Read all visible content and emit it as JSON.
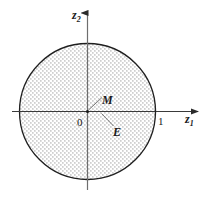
{
  "figure": {
    "background_color": "#ffffff",
    "axes": {
      "x_axis": {
        "label": "z",
        "subscript": "1",
        "name": "horizontal-axis",
        "arrow": "right"
      },
      "y_axis": {
        "label": "z",
        "subscript": "2",
        "name": "vertical-axis",
        "arrow": "up"
      },
      "origin_label": "0"
    },
    "ticks": {
      "x_ticks": [
        {
          "value": "1",
          "position": 1.0
        }
      ]
    },
    "shapes": [
      {
        "name": "unit-disc",
        "type": "circle",
        "center": [
          0,
          0
        ],
        "radius": 1.0,
        "fill": "stipple-dots",
        "fill_color": "#9a9a9a",
        "stroke_color": "#1a1a1a"
      }
    ],
    "annotations": [
      {
        "name": "point-label-M",
        "text": "M",
        "target": "origin",
        "leader": true
      },
      {
        "name": "region-label-E",
        "text": "E",
        "target": "disc-interior",
        "leader": true
      }
    ],
    "colors": {
      "stroke": "#1a1a1a",
      "axis": "#3a3a3a",
      "stipple": "#8c8c8c",
      "background": "#ffffff"
    }
  }
}
